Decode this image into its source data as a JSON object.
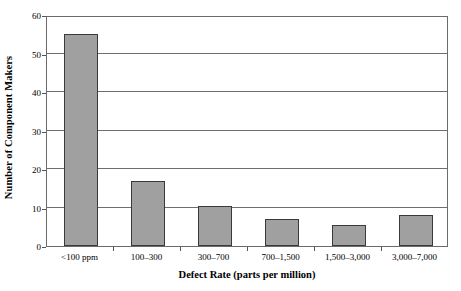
{
  "chart_data": {
    "type": "bar",
    "title": "",
    "categories": [
      "<100 ppm",
      "100–300",
      "300–700",
      "700–1,500",
      "1,500–3,000",
      "3,000–7,000"
    ],
    "values": [
      55,
      17,
      10.5,
      7,
      5.5,
      8
    ],
    "xlabel": "Defect Rate (parts per million)",
    "ylabel": "Number of Component Makers",
    "ylim": [
      0,
      60
    ],
    "ytick_labels": [
      "0",
      "10",
      "20",
      "30",
      "40",
      "50",
      "60"
    ],
    "ytick_values": [
      0,
      10,
      20,
      30,
      40,
      50,
      60
    ],
    "grid": "horizontal",
    "legend": "none",
    "bar_fill_color": "#a0a0a0",
    "bar_edge_color": "#3a3a3a",
    "gridline_color": "#6e6e6e",
    "axis_color": "#6b6b6b",
    "background_color": "#ffffff"
  }
}
